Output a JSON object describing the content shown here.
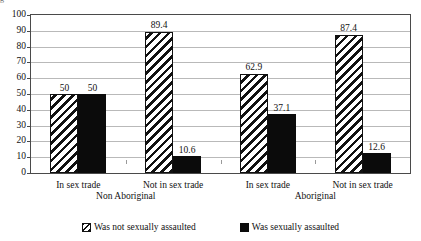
{
  "title_sliver": "g",
  "chart_data": {
    "type": "bar",
    "title": "",
    "xlabel": "",
    "ylabel": "",
    "ylim": [
      0,
      100
    ],
    "yticks": [
      100,
      90,
      80,
      70,
      60,
      50,
      40,
      30,
      20,
      10,
      0
    ],
    "grid": true,
    "legend_position": "bottom",
    "categories": [
      "In sex trade",
      "Not in sex trade",
      "In sex trade",
      "Not in sex trade"
    ],
    "super_categories": [
      {
        "label": "Non Aboriginal",
        "spans": [
          0,
          1
        ]
      },
      {
        "label": "Aboriginal",
        "spans": [
          2,
          3
        ]
      }
    ],
    "series": [
      {
        "name": "Was not sexually assaulted",
        "style": "diagonal-hatch",
        "color": "#ffffff",
        "values": [
          50,
          89.4,
          62.9,
          87.4
        ],
        "labels": [
          "50",
          "89.4",
          "62.9",
          "87.4"
        ]
      },
      {
        "name": "Was sexually assaulted",
        "style": "solid",
        "color": "#0b0b0b",
        "values": [
          50,
          10.6,
          37.1,
          12.6
        ],
        "labels": [
          "50",
          "10.6",
          "37.1",
          "12.6"
        ]
      }
    ]
  },
  "legend": {
    "items": [
      {
        "label": "Was not sexually assaulted",
        "swatch": "hatch-swatch-icon"
      },
      {
        "label": "Was sexually assaulted",
        "swatch": "solid-swatch-icon"
      }
    ]
  }
}
